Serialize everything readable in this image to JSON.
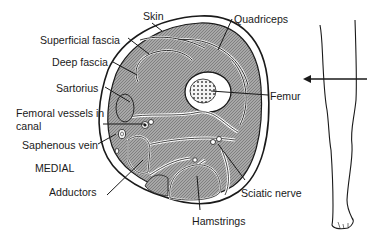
{
  "diagram": {
    "labels": {
      "skin": "Skin",
      "superficial_fascia": "Superficial fascia",
      "deep_fascia": "Deep fascia",
      "sartorius": "Sartorius",
      "femoral_vessels_line1": "Femoral vessels in",
      "femoral_vessels_line2": "canal",
      "saphenous_vein": "Saphenous vein",
      "medial": "MEDIAL",
      "adductors": "Adductors",
      "quadriceps": "Quadriceps",
      "femur": "Femur",
      "sciatic_nerve": "Sciatic nerve",
      "hamstrings": "Hamstrings"
    },
    "colors": {
      "line": "#1a1a1a",
      "muscle_fill": "#9a9a9a",
      "background": "#ffffff"
    }
  }
}
